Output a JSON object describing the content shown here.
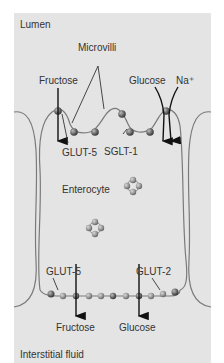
{
  "diagram": {
    "regions": {
      "top": "Lumen",
      "bottom": "Interstitial fluid",
      "cell": "Enterocyte"
    },
    "labels": {
      "microvilli": "Microvilli",
      "fructose_top": "Fructose",
      "glucose_top": "Glucose",
      "sodium": "Na⁺",
      "glut5_apical": "GLUT-5",
      "sglt1": "SGLT-1",
      "glut5_basal": "GLUT-5",
      "glut2": "GLUT-2",
      "fructose_bottom": "Fructose",
      "glucose_bottom": "Glucose"
    },
    "colors": {
      "background": "#e4e4e4",
      "membrane": "#7a7a7a",
      "protein": "#5a5a5a",
      "arrow": "#111111",
      "text": "#333333"
    }
  }
}
